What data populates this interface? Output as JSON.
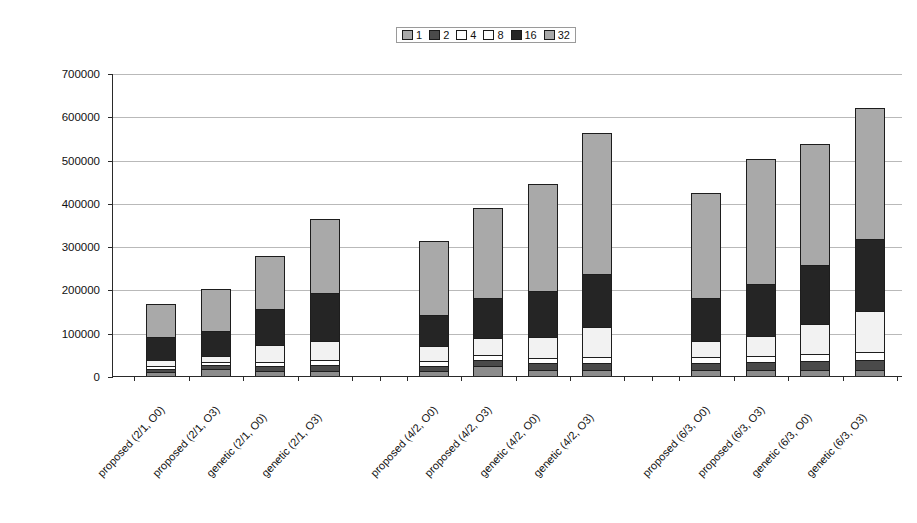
{
  "chart_data": {
    "type": "bar",
    "stacked": true,
    "title": "",
    "xlabel": "",
    "ylabel": "Extra Area Cost",
    "ylim": [
      0,
      700000
    ],
    "ytick_step": 100000,
    "yticks": [
      "0",
      "100000",
      "200000",
      "300000",
      "400000",
      "500000",
      "600000",
      "700000"
    ],
    "grid": true,
    "legend_position": "top-center",
    "legend_entries": [
      "1",
      "2",
      "4",
      "8",
      "16",
      "32"
    ],
    "categories": [
      "proposed (2/1, O0)",
      "proposed (2/1, O3)",
      "genetic (2/1, O0)",
      "genetic (2/1, O3)",
      "proposed (4/2, O0)",
      "proposed (4/2, O3)",
      "genetic (4/2, O0)",
      "genetic (4/2, O3)",
      "proposed (6/3, O0)",
      "proposed (6/3, O3)",
      "genetic (6/3, O0)",
      "genetic (6/3, O3)"
    ],
    "group_breaks_after": [
      3,
      7
    ],
    "series": [
      {
        "name": "1",
        "color": "#8c8c8c",
        "values": [
          9000,
          16000,
          11000,
          12000,
          11000,
          24000,
          13000,
          13000,
          13000,
          14000,
          14000,
          15000
        ]
      },
      {
        "name": "2",
        "color": "#4a4a4a",
        "values": [
          8000,
          10000,
          12000,
          14000,
          13000,
          13000,
          16000,
          17000,
          16000,
          18000,
          20000,
          22000
        ]
      },
      {
        "name": "4",
        "color": "#ffffff",
        "values": [
          7000,
          7000,
          9000,
          11000,
          10000,
          11000,
          13000,
          14000,
          14000,
          15000,
          17000,
          19000
        ]
      },
      {
        "name": "8",
        "color": "#f2f2f2",
        "values": [
          13000,
          14000,
          40000,
          44000,
          35000,
          40000,
          48000,
          70000,
          39000,
          46000,
          70000,
          95000
        ]
      },
      {
        "name": "16",
        "color": "#252525",
        "values": [
          53000,
          57000,
          82000,
          112000,
          73000,
          93000,
          106000,
          122000,
          98000,
          120000,
          135000,
          165000
        ]
      },
      {
        "name": "32",
        "color": "#a9a9a9",
        "values": [
          77000,
          97000,
          124000,
          169000,
          171000,
          207000,
          247000,
          325000,
          242000,
          288000,
          281000,
          304000
        ]
      }
    ],
    "totals": [
      167000,
      201000,
      278000,
      362000,
      313000,
      388000,
      443000,
      561000,
      422000,
      501000,
      537000,
      620000
    ]
  }
}
